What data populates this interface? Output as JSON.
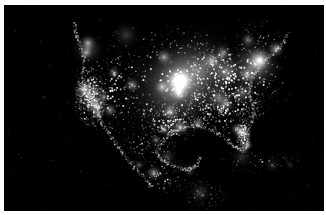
{
  "image": {
    "title": "North America at Night",
    "subject": "Composite satellite view of artificial night-time lights over North America",
    "type": "night-lights-satellite-image",
    "width": 326,
    "height": 215,
    "margins": {
      "top": 5,
      "left": 4,
      "right": 2,
      "bottom": 4,
      "color": "#fefefe"
    },
    "plate": {
      "x": 4,
      "y": 5,
      "width": 320,
      "height": 206,
      "background": "#000000"
    },
    "palette": {
      "background": "#000000",
      "light_low": "#2b2b2b",
      "light_mid": "#9a9a9a",
      "light_high": "#ffffff",
      "page": "#fefefe"
    },
    "rendering": {
      "grayscale": true,
      "speckle_seed": 20240117,
      "speckle_count": 5200
    }
  },
  "regions": [
    {
      "name": "pacific-ocean",
      "label": "Pacific Ocean",
      "brightness": 0.02
    },
    {
      "name": "atlantic-ocean",
      "label": "Atlantic Ocean",
      "brightness": 0.02
    },
    {
      "name": "canada-north",
      "label": "Northern Canada",
      "brightness": 0.06
    },
    {
      "name": "us-west-coast",
      "label": "U.S. West Coast",
      "brightness": 0.78
    },
    {
      "name": "us-midwest",
      "label": "U.S. Midwest",
      "brightness": 0.95
    },
    {
      "name": "us-northeast",
      "label": "U.S. Northeast Corridor",
      "brightness": 0.92
    },
    {
      "name": "us-southeast",
      "label": "U.S. Southeast",
      "brightness": 0.62
    },
    {
      "name": "us-texas",
      "label": "Texas and Gulf Coast",
      "brightness": 0.7
    },
    {
      "name": "mexico",
      "label": "Mexico",
      "brightness": 0.35
    },
    {
      "name": "central-america",
      "label": "Central America",
      "brightness": 0.22
    },
    {
      "name": "caribbean",
      "label": "Caribbean Islands",
      "brightness": 0.18
    }
  ],
  "light_clusters": [
    {
      "name": "chicago-core",
      "x": 176,
      "y": 76,
      "r": 17,
      "i": 1.0
    },
    {
      "name": "chicago-halo",
      "x": 176,
      "y": 76,
      "r": 40,
      "i": 0.52
    },
    {
      "name": "great-lakes-belt",
      "x": 196,
      "y": 64,
      "r": 46,
      "i": 0.4
    },
    {
      "name": "midwest-spread",
      "x": 168,
      "y": 86,
      "r": 58,
      "i": 0.34
    },
    {
      "name": "new-york",
      "x": 256,
      "y": 55,
      "r": 14,
      "i": 0.92
    },
    {
      "name": "boston",
      "x": 272,
      "y": 44,
      "r": 10,
      "i": 0.72
    },
    {
      "name": "northeast-corridor",
      "x": 251,
      "y": 60,
      "r": 30,
      "i": 0.56
    },
    {
      "name": "washington-dc",
      "x": 243,
      "y": 70,
      "r": 11,
      "i": 0.68
    },
    {
      "name": "pittsburgh-ohio",
      "x": 222,
      "y": 67,
      "r": 20,
      "i": 0.55
    },
    {
      "name": "detroit",
      "x": 208,
      "y": 56,
      "r": 12,
      "i": 0.66
    },
    {
      "name": "toronto",
      "x": 219,
      "y": 48,
      "r": 10,
      "i": 0.58
    },
    {
      "name": "minneapolis",
      "x": 160,
      "y": 52,
      "r": 10,
      "i": 0.62
    },
    {
      "name": "st-louis",
      "x": 175,
      "y": 88,
      "r": 10,
      "i": 0.62
    },
    {
      "name": "kansas-city",
      "x": 158,
      "y": 82,
      "r": 9,
      "i": 0.55
    },
    {
      "name": "nashville-atlanta",
      "x": 215,
      "y": 93,
      "r": 16,
      "i": 0.52
    },
    {
      "name": "atlanta",
      "x": 222,
      "y": 99,
      "r": 10,
      "i": 0.62
    },
    {
      "name": "carolinas",
      "x": 238,
      "y": 88,
      "r": 16,
      "i": 0.44
    },
    {
      "name": "florida-peninsula",
      "x": 238,
      "y": 128,
      "r": 9,
      "i": 0.7
    },
    {
      "name": "miami",
      "x": 243,
      "y": 140,
      "r": 7,
      "i": 0.72
    },
    {
      "name": "tampa-orlando",
      "x": 233,
      "y": 124,
      "r": 8,
      "i": 0.62
    },
    {
      "name": "houston",
      "x": 176,
      "y": 122,
      "r": 10,
      "i": 0.7
    },
    {
      "name": "dallas",
      "x": 166,
      "y": 107,
      "r": 10,
      "i": 0.7
    },
    {
      "name": "san-antonio",
      "x": 160,
      "y": 124,
      "r": 8,
      "i": 0.52
    },
    {
      "name": "new-orleans",
      "x": 194,
      "y": 118,
      "r": 8,
      "i": 0.54
    },
    {
      "name": "denver",
      "x": 128,
      "y": 80,
      "r": 9,
      "i": 0.62
    },
    {
      "name": "salt-lake-city",
      "x": 110,
      "y": 68,
      "r": 8,
      "i": 0.5
    },
    {
      "name": "phoenix",
      "x": 106,
      "y": 105,
      "r": 9,
      "i": 0.58
    },
    {
      "name": "los-angeles",
      "x": 92,
      "y": 101,
      "r": 12,
      "i": 0.86
    },
    {
      "name": "san-diego",
      "x": 94,
      "y": 110,
      "r": 7,
      "i": 0.58
    },
    {
      "name": "san-francisco",
      "x": 80,
      "y": 84,
      "r": 10,
      "i": 0.78
    },
    {
      "name": "central-valley",
      "x": 86,
      "y": 90,
      "r": 20,
      "i": 0.48
    },
    {
      "name": "portland",
      "x": 82,
      "y": 48,
      "r": 8,
      "i": 0.56
    },
    {
      "name": "seattle-vancouver",
      "x": 84,
      "y": 38,
      "r": 9,
      "i": 0.62
    },
    {
      "name": "las-vegas",
      "x": 100,
      "y": 92,
      "r": 7,
      "i": 0.58
    },
    {
      "name": "pacific-northwest",
      "x": 84,
      "y": 44,
      "r": 18,
      "i": 0.36
    },
    {
      "name": "alberta-prairies",
      "x": 122,
      "y": 30,
      "r": 16,
      "i": 0.24
    },
    {
      "name": "montreal",
      "x": 244,
      "y": 35,
      "r": 9,
      "i": 0.52
    },
    {
      "name": "mexico-city",
      "x": 150,
      "y": 168,
      "r": 9,
      "i": 0.66
    },
    {
      "name": "monterrey",
      "x": 152,
      "y": 135,
      "r": 7,
      "i": 0.46
    },
    {
      "name": "guadalajara",
      "x": 135,
      "y": 160,
      "r": 6,
      "i": 0.42
    },
    {
      "name": "mexico-gulf-coast",
      "x": 163,
      "y": 152,
      "r": 12,
      "i": 0.28
    },
    {
      "name": "yucatan",
      "x": 186,
      "y": 165,
      "r": 10,
      "i": 0.22
    },
    {
      "name": "central-america-arc",
      "x": 196,
      "y": 188,
      "r": 14,
      "i": 0.24
    },
    {
      "name": "cuba",
      "x": 238,
      "y": 152,
      "r": 13,
      "i": 0.2
    },
    {
      "name": "hispaniola",
      "x": 268,
      "y": 160,
      "r": 10,
      "i": 0.18
    },
    {
      "name": "puerto-rico",
      "x": 286,
      "y": 160,
      "r": 6,
      "i": 0.18
    },
    {
      "name": "ocean-beacon-pacific",
      "x": 40,
      "y": 92,
      "r": 3,
      "i": 0.22
    }
  ],
  "landmass_fields": [
    {
      "name": "conus-core",
      "cx": 180,
      "cy": 82,
      "rx": 92,
      "ry": 46,
      "density": 1.0,
      "gain": 1.0
    },
    {
      "name": "conus-east",
      "cx": 228,
      "cy": 76,
      "rx": 52,
      "ry": 40,
      "density": 1.0,
      "gain": 0.95
    },
    {
      "name": "conus-west",
      "cx": 108,
      "cy": 84,
      "rx": 40,
      "ry": 44,
      "density": 0.62,
      "gain": 0.7
    },
    {
      "name": "california-strip",
      "cx": 86,
      "cy": 92,
      "rx": 16,
      "ry": 30,
      "density": 0.95,
      "gain": 0.92
    },
    {
      "name": "southeast",
      "cx": 218,
      "cy": 104,
      "rx": 40,
      "ry": 26,
      "density": 0.8,
      "gain": 0.7
    },
    {
      "name": "florida",
      "cx": 239,
      "cy": 130,
      "rx": 7,
      "ry": 18,
      "density": 0.85,
      "gain": 0.78
    },
    {
      "name": "texas",
      "cx": 166,
      "cy": 116,
      "rx": 30,
      "ry": 22,
      "density": 0.72,
      "gain": 0.72
    },
    {
      "name": "canada-band",
      "cx": 170,
      "cy": 36,
      "rx": 100,
      "ry": 20,
      "density": 0.26,
      "gain": 0.42
    },
    {
      "name": "canada-maritimes",
      "cx": 258,
      "cy": 30,
      "rx": 30,
      "ry": 16,
      "density": 0.24,
      "gain": 0.4
    },
    {
      "name": "mexico-north",
      "cx": 140,
      "cy": 140,
      "rx": 32,
      "ry": 22,
      "density": 0.34,
      "gain": 0.5
    },
    {
      "name": "mexico-south",
      "cx": 160,
      "cy": 170,
      "rx": 28,
      "ry": 20,
      "density": 0.34,
      "gain": 0.5
    },
    {
      "name": "central-america",
      "cx": 198,
      "cy": 190,
      "rx": 24,
      "ry": 16,
      "density": 0.26,
      "gain": 0.44
    },
    {
      "name": "caribbean-arc",
      "cx": 258,
      "cy": 156,
      "rx": 44,
      "ry": 12,
      "density": 0.2,
      "gain": 0.4
    }
  ],
  "coastlines": [
    {
      "name": "atlantic-seaboard",
      "points": [
        [
          284,
          28
        ],
        [
          276,
          40
        ],
        [
          266,
          50
        ],
        [
          258,
          58
        ],
        [
          250,
          68
        ],
        [
          246,
          78
        ],
        [
          244,
          88
        ],
        [
          248,
          98
        ],
        [
          250,
          108
        ],
        [
          246,
          118
        ],
        [
          242,
          128
        ],
        [
          244,
          140
        ],
        [
          238,
          146
        ],
        [
          228,
          140
        ],
        [
          220,
          132
        ],
        [
          210,
          126
        ],
        [
          200,
          122
        ],
        [
          190,
          120
        ],
        [
          180,
          122
        ]
      ]
    },
    {
      "name": "pacific-seaboard",
      "points": [
        [
          70,
          18
        ],
        [
          72,
          30
        ],
        [
          76,
          42
        ],
        [
          80,
          56
        ],
        [
          78,
          70
        ],
        [
          82,
          84
        ],
        [
          88,
          96
        ],
        [
          94,
          108
        ],
        [
          98,
          118
        ],
        [
          104,
          128
        ],
        [
          112,
          138
        ],
        [
          120,
          150
        ],
        [
          130,
          162
        ],
        [
          140,
          172
        ],
        [
          148,
          182
        ]
      ]
    },
    {
      "name": "gulf-of-mexico",
      "points": [
        [
          180,
          122
        ],
        [
          170,
          126
        ],
        [
          162,
          132
        ],
        [
          156,
          138
        ],
        [
          152,
          146
        ],
        [
          156,
          154
        ],
        [
          164,
          158
        ],
        [
          174,
          162
        ],
        [
          184,
          164
        ],
        [
          192,
          160
        ],
        [
          196,
          152
        ]
      ]
    }
  ]
}
